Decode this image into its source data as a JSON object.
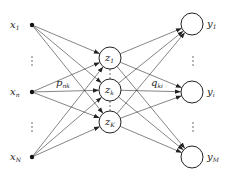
{
  "diagram": {
    "type": "neural-network",
    "input_nodes": [
      {
        "id": "x1",
        "label": "x",
        "sub": "1",
        "cx": 32,
        "cy": 25
      },
      {
        "id": "xn",
        "label": "x",
        "sub": "n",
        "cx": 32,
        "cy": 92
      },
      {
        "id": "xN",
        "label": "x",
        "sub": "N",
        "cx": 32,
        "cy": 157
      }
    ],
    "hidden_nodes": [
      {
        "id": "z1",
        "label": "z",
        "sub": "1",
        "cx": 110,
        "cy": 58
      },
      {
        "id": "zk",
        "label": "z",
        "sub": "k",
        "cx": 110,
        "cy": 90
      },
      {
        "id": "zK",
        "label": "z",
        "sub": "K",
        "cx": 110,
        "cy": 122
      }
    ],
    "output_nodes": [
      {
        "id": "y1",
        "label": "y",
        "sub": "1",
        "cx": 192,
        "cy": 24
      },
      {
        "id": "yi",
        "label": "y",
        "sub": "i",
        "cx": 192,
        "cy": 92
      },
      {
        "id": "yM",
        "label": "y",
        "sub": "M",
        "cx": 192,
        "cy": 157
      }
    ],
    "weight_labels": {
      "input_hidden": {
        "label": "p",
        "sub": "nk"
      },
      "hidden_output": {
        "label": "q",
        "sub": "ki"
      }
    },
    "ellipsis": "⋮"
  }
}
